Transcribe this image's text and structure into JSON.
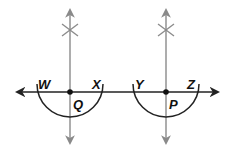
{
  "diagram": {
    "colors": {
      "horizontal_line": "#222222",
      "vertical_lines": "#8a8a8a",
      "arcs": "#222222",
      "points": "#111111",
      "labels": "#111111"
    },
    "horizontal_line": {
      "x1": 17,
      "x2": 218,
      "y": 92
    },
    "constructions": [
      {
        "center_label": "Q",
        "cx": 70,
        "cy": 92,
        "radius": 33,
        "left_label": "W",
        "right_label": "X",
        "vertical": {
          "x": 70,
          "y1": 10,
          "y2": 143,
          "cross_y": 30
        }
      },
      {
        "center_label": "P",
        "cx": 166,
        "cy": 92,
        "radius": 33,
        "left_label": "Y",
        "right_label": "Z",
        "vertical": {
          "x": 166,
          "y1": 10,
          "y2": 143,
          "cross_y": 30
        }
      }
    ],
    "labels": {
      "W": "W",
      "X": "X",
      "Q": "Q",
      "Y": "Y",
      "Z": "Z",
      "P": "P"
    }
  }
}
